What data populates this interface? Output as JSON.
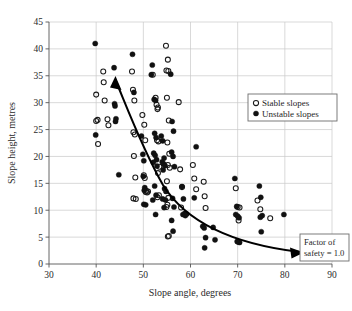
{
  "chart_data": {
    "type": "scatter",
    "title": "",
    "xlabel": "Slope angle, degrees",
    "ylabel": "Slope height, metres",
    "xlim": [
      30,
      90
    ],
    "ylim": [
      0,
      45
    ],
    "xticks": [
      30,
      40,
      50,
      60,
      70,
      80,
      90
    ],
    "yticks": [
      0,
      5,
      10,
      15,
      20,
      25,
      30,
      35,
      40,
      45
    ],
    "grid": true,
    "legend_position": "upper-right",
    "series": [
      {
        "name": "Stable slopes",
        "marker": "open-circle",
        "color": "#111111",
        "points": [
          [
            40.0,
            31.5
          ],
          [
            40.3,
            26.8
          ],
          [
            40.0,
            26.6
          ],
          [
            40.4,
            22.3
          ],
          [
            41.5,
            35.8
          ],
          [
            41.6,
            33.8
          ],
          [
            41.8,
            30.4
          ],
          [
            42.4,
            26.9
          ],
          [
            42.6,
            25.8
          ],
          [
            47.6,
            35.8
          ],
          [
            47.8,
            32.4
          ],
          [
            48.1,
            30.4
          ],
          [
            47.9,
            24.5
          ],
          [
            48.2,
            24.1
          ],
          [
            48.0,
            20.1
          ],
          [
            48.3,
            16.1
          ],
          [
            47.9,
            12.2
          ],
          [
            48.4,
            12.1
          ],
          [
            49.8,
            27.7
          ],
          [
            50.2,
            25.9
          ],
          [
            50.4,
            23.0
          ],
          [
            50.1,
            16.5
          ],
          [
            50.3,
            16.0
          ],
          [
            50.6,
            13.6
          ],
          [
            50.5,
            13.4
          ],
          [
            50.8,
            13.3
          ],
          [
            51.0,
            13.5
          ],
          [
            52.0,
            35.2
          ],
          [
            52.6,
            30.9
          ],
          [
            52.8,
            29.6
          ],
          [
            53.1,
            29.1
          ],
          [
            53.0,
            28.8
          ],
          [
            52.9,
            23.0
          ],
          [
            53.2,
            22.8
          ],
          [
            53.4,
            18.1
          ],
          [
            53.1,
            16.9
          ],
          [
            53.3,
            12.8
          ],
          [
            53.0,
            12.4
          ],
          [
            54.8,
            40.6
          ],
          [
            55.2,
            38.0
          ],
          [
            54.9,
            36.0
          ],
          [
            55.3,
            35.9
          ],
          [
            55.0,
            30.9
          ],
          [
            55.4,
            26.7
          ],
          [
            55.1,
            22.6
          ],
          [
            55.5,
            20.5
          ],
          [
            55.2,
            18.4
          ],
          [
            55.6,
            17.9
          ],
          [
            55.0,
            15.4
          ],
          [
            55.3,
            12.3
          ],
          [
            55.1,
            11.0
          ],
          [
            54.9,
            10.6
          ],
          [
            55.4,
            5.2
          ],
          [
            55.2,
            5.1
          ],
          [
            57.5,
            30.1
          ],
          [
            57.8,
            17.6
          ],
          [
            58.2,
            14.3
          ],
          [
            58.0,
            10.5
          ],
          [
            60.5,
            18.4
          ],
          [
            60.8,
            15.9
          ],
          [
            61.2,
            13.9
          ],
          [
            62.8,
            15.3
          ],
          [
            63.0,
            12.6
          ],
          [
            63.2,
            10.4
          ],
          [
            69.6,
            14.1
          ],
          [
            70.0,
            10.6
          ],
          [
            70.4,
            10.5
          ],
          [
            70.2,
            8.1
          ],
          [
            74.2,
            11.8
          ],
          [
            74.8,
            10.2
          ],
          [
            76.9,
            8.5
          ]
        ]
      },
      {
        "name": "Unstable slopes",
        "marker": "filled-circle",
        "color": "#111111",
        "points": [
          [
            39.8,
            41.0
          ],
          [
            39.9,
            24.0
          ],
          [
            43.8,
            36.5
          ],
          [
            43.9,
            29.8
          ],
          [
            44.0,
            29.4
          ],
          [
            44.2,
            27.0
          ],
          [
            44.1,
            26.5
          ],
          [
            44.8,
            16.6
          ],
          [
            47.7,
            39.0
          ],
          [
            48.0,
            31.9
          ],
          [
            49.6,
            23.8
          ],
          [
            49.9,
            20.4
          ],
          [
            50.1,
            19.2
          ],
          [
            50.0,
            16.3
          ],
          [
            50.3,
            14.2
          ],
          [
            50.2,
            13.7
          ],
          [
            50.5,
            11.0
          ],
          [
            50.1,
            11.1
          ],
          [
            51.7,
            35.2
          ],
          [
            51.9,
            37.0
          ],
          [
            52.3,
            30.6
          ],
          [
            52.6,
            30.4
          ],
          [
            52.4,
            24.3
          ],
          [
            52.7,
            23.5
          ],
          [
            52.2,
            20.6
          ],
          [
            52.5,
            20.2
          ],
          [
            52.8,
            19.4
          ],
          [
            52.1,
            18.9
          ],
          [
            52.9,
            18.2
          ],
          [
            52.4,
            14.5
          ],
          [
            52.7,
            12.8
          ],
          [
            52.0,
            11.9
          ],
          [
            52.6,
            9.2
          ],
          [
            53.8,
            23.8
          ],
          [
            54.1,
            22.9
          ],
          [
            54.4,
            19.7
          ],
          [
            54.0,
            19.0
          ],
          [
            54.3,
            18.6
          ],
          [
            54.6,
            18.3
          ],
          [
            54.2,
            17.5
          ],
          [
            54.5,
            14.0
          ],
          [
            54.8,
            13.5
          ],
          [
            54.1,
            12.1
          ],
          [
            54.7,
            11.9
          ],
          [
            54.4,
            10.5
          ],
          [
            55.8,
            35.3
          ],
          [
            56.1,
            26.5
          ],
          [
            56.4,
            24.7
          ],
          [
            56.0,
            20.8
          ],
          [
            56.3,
            20.0
          ],
          [
            56.6,
            18.1
          ],
          [
            56.2,
            12.2
          ],
          [
            56.5,
            10.6
          ],
          [
            56.0,
            8.1
          ],
          [
            56.3,
            6.1
          ],
          [
            58.2,
            14.4
          ],
          [
            58.5,
            12.1
          ],
          [
            58.8,
            9.4
          ],
          [
            58.4,
            9.2
          ],
          [
            58.9,
            9.0
          ],
          [
            59.2,
            9.3
          ],
          [
            60.8,
            12.3
          ],
          [
            61.2,
            21.8
          ],
          [
            62.6,
            7.0
          ],
          [
            62.9,
            6.7
          ],
          [
            63.2,
            4.9
          ],
          [
            63.0,
            3.0
          ],
          [
            64.8,
            6.8
          ],
          [
            65.2,
            4.5
          ],
          [
            69.4,
            15.9
          ],
          [
            69.8,
            10.7
          ],
          [
            69.6,
            9.2
          ],
          [
            70.0,
            8.9
          ],
          [
            70.3,
            8.6
          ],
          [
            70.1,
            4.1
          ],
          [
            70.4,
            4.0
          ],
          [
            69.9,
            4.2
          ],
          [
            74.6,
            14.5
          ],
          [
            74.9,
            12.4
          ],
          [
            75.2,
            9.0
          ],
          [
            74.8,
            8.7
          ],
          [
            75.0,
            6.0
          ],
          [
            79.8,
            9.2
          ]
        ]
      }
    ],
    "annotations": [
      {
        "name": "factor-of-safety",
        "line1": "Factor of",
        "line2": "safety = 1.0",
        "curve_description": "Downward-sloping power curve from (45, 34) to (80, 4) with double arrowheads"
      }
    ]
  },
  "legend": {
    "entries": [
      {
        "label": "Stable slopes",
        "marker": "open-circle"
      },
      {
        "label": "Unstable slopes",
        "marker": "filled-circle"
      }
    ]
  },
  "colors": {
    "grid": "#c9c9c9",
    "axis": "#555555",
    "marker": "#111111",
    "curve": "#000000",
    "box_border": "#6e6e6e",
    "background": "#ffffff"
  }
}
